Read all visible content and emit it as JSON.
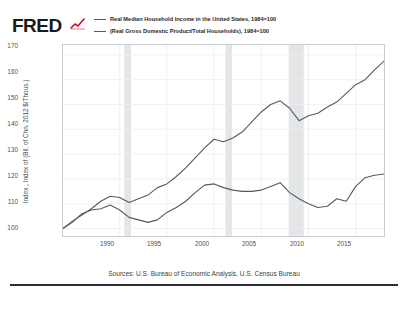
{
  "brand": {
    "logo_text": "FRED",
    "logo_icon": "red-line-chart-squiggle",
    "accent_color": "#c8102e"
  },
  "legend": {
    "position": "top",
    "entries": [
      {
        "label": "Real Median Household Income in the United States, 1984=100",
        "color": "#555a5e"
      },
      {
        "label": "(Real Gross Domestic Product/Total Households), 1984=100",
        "color": "#555a5e"
      }
    ]
  },
  "axes": {
    "ylabel": "Index , Index of (Bil. of Chn. 2012 $/Thous.)",
    "yticks": [
      "170",
      "160",
      "150",
      "140",
      "130",
      "120",
      "110",
      "100"
    ],
    "xticks": [
      "1990",
      "1995",
      "2000",
      "2005",
      "2010",
      "2015"
    ]
  },
  "footer": {
    "sources": "Sources: U.S. Bureau of Economic Analysis, U.S. Census Bureau"
  },
  "chart_data": {
    "type": "line",
    "title": "",
    "subtitle": "",
    "xlabel": "",
    "ylabel": "Index , Index of (Bil. of Chn. 2012 $/Thous.)",
    "xlim": [
      1984,
      2018
    ],
    "ylim": [
      97,
      174
    ],
    "yticks": [
      100,
      110,
      120,
      130,
      140,
      150,
      160,
      170
    ],
    "xticks": [
      1990,
      1995,
      2000,
      2005,
      2010,
      2015
    ],
    "grid": true,
    "legend_position": "top",
    "x": [
      1984,
      1985,
      1986,
      1987,
      1988,
      1989,
      1990,
      1991,
      1992,
      1993,
      1994,
      1995,
      1996,
      1997,
      1998,
      1999,
      2000,
      2001,
      2002,
      2003,
      2004,
      2005,
      2006,
      2007,
      2008,
      2009,
      2010,
      2011,
      2012,
      2013,
      2014,
      2015,
      2016,
      2017,
      2018
    ],
    "series": [
      {
        "name": "(Real Gross Domestic Product/Total Households), 1984=100",
        "color": "#555a5e",
        "values": [
          100.0,
          103.0,
          105.5,
          108.0,
          111.0,
          113.0,
          112.5,
          110.5,
          112.0,
          113.5,
          116.5,
          118.0,
          121.0,
          124.5,
          128.5,
          132.5,
          136.0,
          135.0,
          136.5,
          139.0,
          143.0,
          147.0,
          150.0,
          151.5,
          148.5,
          143.5,
          145.5,
          146.5,
          149.0,
          151.0,
          154.5,
          158.0,
          160.0,
          164.0,
          167.5
        ]
      },
      {
        "name": "Real Median Household Income in the United States, 1984=100",
        "color": "#555a5e",
        "values": [
          100.0,
          102.5,
          106.0,
          107.5,
          108.0,
          109.5,
          107.5,
          104.5,
          103.5,
          102.5,
          103.5,
          106.5,
          108.5,
          111.0,
          114.5,
          117.5,
          118.0,
          116.5,
          115.5,
          115.0,
          115.0,
          115.5,
          117.0,
          118.5,
          114.5,
          112.0,
          110.0,
          108.5,
          109.0,
          112.0,
          111.0,
          117.0,
          120.5,
          121.5,
          122.0
        ]
      }
    ],
    "recession_bands": [
      {
        "start": 1990.5,
        "end": 1991.2
      },
      {
        "start": 2001.2,
        "end": 2001.9
      },
      {
        "start": 2007.9,
        "end": 2009.5
      }
    ],
    "recession_band_color": "#e3e5e7"
  }
}
